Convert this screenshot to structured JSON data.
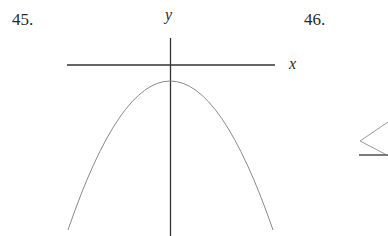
{
  "problems": [
    {
      "number": "45.",
      "x_axis_label": "x",
      "y_axis_label": "y",
      "curve": "downward-opening parabola with vertex on y-axis below x-axis"
    },
    {
      "number": "46."
    }
  ],
  "colors": {
    "axis": "#333333",
    "curve": "#888888",
    "text": "#2a2a2a"
  }
}
